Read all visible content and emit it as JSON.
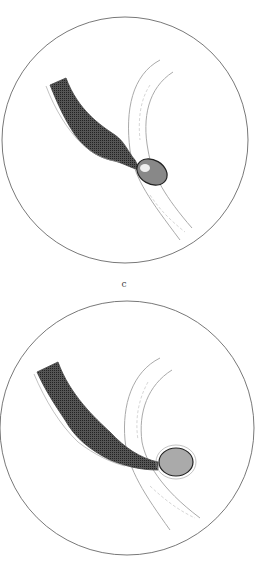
{
  "figures": [
    {
      "id": "c",
      "label": "c",
      "description": "Circular microscope field: dark shaded tube narrowing to a small oval body at junction with a pale branching vessel"
    },
    {
      "id": "d",
      "label": "d",
      "description": "Circular microscope field: dark shaded tube narrowing into a rounded bulb protruding through a pale branching vessel"
    }
  ],
  "credit": "",
  "colors": {
    "ink": "#333333",
    "outline": "#555555",
    "pale": "#bbbbbb",
    "background": "#ffffff"
  }
}
